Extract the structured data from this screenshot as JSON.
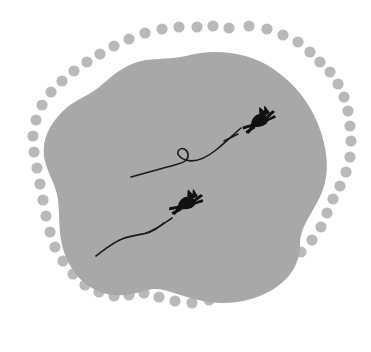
{
  "canvas": {
    "width": 371,
    "height": 352,
    "background_color": "#ffffff",
    "title": "Amoeba blob with dotted outline and two flying silhouettes"
  },
  "colors": {
    "blob_fill": "#a8a8a8",
    "dot_fill": "#b9b9b9",
    "figure_fill": "#111111",
    "trail_stroke": "#1a1a1a",
    "background": "#ffffff"
  },
  "blob": {
    "label": "amoeba-shape",
    "fill": "#a8a8a8",
    "path": "M 186 56 C 214 48 248 52 272 68 C 296 84 310 104 318 124 C 328 150 330 172 322 192 C 314 212 300 226 300 244 C 300 262 292 278 272 290 C 250 303 222 306 198 300 C 176 295 162 286 148 290 C 132 295 116 298 100 292 C 82 285 70 270 64 252 C 58 234 60 216 58 200 C 56 183 46 172 44 156 C 42 139 50 124 62 112 C 74 100 88 96 98 88 C 110 78 118 70 132 64 C 148 57 168 60 186 56 Z"
  },
  "dots": {
    "label": "dotted-ring",
    "fill": "#b9b9b9",
    "radius": 5.6,
    "count": 47,
    "positions": [
      [
        197,
        27
      ],
      [
        213,
        26
      ],
      [
        229,
        28
      ],
      [
        249,
        26
      ],
      [
        267,
        29
      ],
      [
        283,
        35
      ],
      [
        298,
        42
      ],
      [
        310,
        52
      ],
      [
        320,
        62
      ],
      [
        330,
        72
      ],
      [
        338,
        84
      ],
      [
        344,
        97
      ],
      [
        348,
        111
      ],
      [
        350,
        126
      ],
      [
        351,
        141
      ],
      [
        350,
        157
      ],
      [
        346,
        172
      ],
      [
        340,
        186
      ],
      [
        333,
        199
      ],
      [
        327,
        213
      ],
      [
        321,
        227
      ],
      [
        312,
        240
      ],
      [
        301,
        252
      ],
      [
        288,
        263
      ],
      [
        274,
        273
      ],
      [
        259,
        282
      ],
      [
        243,
        290
      ],
      [
        226,
        296
      ],
      [
        209,
        300
      ],
      [
        192,
        303
      ],
      [
        175,
        301
      ],
      [
        159,
        297
      ],
      [
        144,
        293
      ],
      [
        129,
        295
      ],
      [
        114,
        296
      ],
      [
        99,
        292
      ],
      [
        85,
        285
      ],
      [
        73,
        274
      ],
      [
        63,
        261
      ],
      [
        55,
        247
      ],
      [
        50,
        232
      ],
      [
        46,
        216
      ],
      [
        43,
        200
      ],
      [
        40,
        184
      ],
      [
        37,
        168
      ],
      [
        34,
        152
      ],
      [
        33,
        136
      ],
      [
        36,
        120
      ],
      [
        42,
        105
      ],
      [
        51,
        92
      ],
      [
        62,
        81
      ],
      [
        74,
        71
      ],
      [
        87,
        62
      ],
      [
        100,
        54
      ],
      [
        114,
        46
      ],
      [
        129,
        39
      ],
      [
        145,
        33
      ],
      [
        162,
        29
      ],
      [
        179,
        27
      ]
    ]
  },
  "figures": [
    {
      "name": "upper-silhouette",
      "label": "flying figure upper right",
      "fill": "#111111",
      "cx": 255,
      "cy": 123,
      "rotation": -28
    },
    {
      "name": "lower-silhouette",
      "label": "flying figure lower left",
      "fill": "#111111",
      "cx": 182,
      "cy": 205,
      "rotation": -22
    }
  ],
  "trails": [
    {
      "name": "upper-trail",
      "label": "curved trail with loop",
      "stroke": "#1a1a1a",
      "stroke_width": 1.6,
      "path": "M 131 177 C 148 172 164 168 178 164 C 186 162 189 159 188 154 C 187 149 182 147 179 150 C 176 153 179 158 186 160 C 196 163 206 158 216 150 C 226 142 234 134 241 128",
      "has_loop": true,
      "loop_center": [
        184,
        154
      ],
      "loop_radius": 5
    },
    {
      "name": "upper-trail-dash",
      "label": "short dash before upper figure",
      "stroke": "#1a1a1a",
      "stroke_width": 1.6,
      "path": "M 224 141 L 238 134"
    },
    {
      "name": "lower-trail",
      "label": "curved trail lower",
      "stroke": "#1a1a1a",
      "stroke_width": 1.6,
      "path": "M 96 256 C 104 250 112 243 122 239 C 132 235 142 235 150 232 C 157 229 160 226 164 223"
    },
    {
      "name": "lower-trail-dash",
      "label": "short dash before lower figure",
      "stroke": "#1a1a1a",
      "stroke_width": 1.6,
      "path": "M 146 233 C 155 230 163 224 172 218"
    }
  ]
}
